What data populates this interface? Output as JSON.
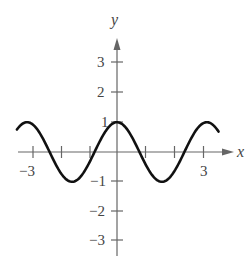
{
  "chart_data": {
    "type": "line",
    "title": "",
    "xlabel": "x",
    "ylabel": "y",
    "function": "y = cos(2x)",
    "xlim": [
      -3.5,
      3.6
    ],
    "ylim": [
      -3.5,
      3.7
    ],
    "x_ticks": [
      -3,
      -2,
      -1,
      1,
      2,
      3
    ],
    "x_tick_labels": [
      "-3",
      "3"
    ],
    "y_ticks": [
      -3,
      -2,
      -1,
      1,
      2,
      3
    ],
    "y_tick_labels": [
      "3",
      "2",
      "1",
      "−1",
      "−2",
      "−3"
    ],
    "series": [
      {
        "name": "cos(2x)",
        "x": [
          -3.5,
          -3.14,
          -2.36,
          -1.57,
          -0.79,
          0,
          0.79,
          1.57,
          2.36,
          3.14,
          3.55
        ],
        "values": [
          0.75,
          1,
          0,
          -1,
          0,
          1,
          0,
          -1,
          0,
          1,
          0.72
        ]
      }
    ],
    "grid": false,
    "legend": "none"
  },
  "labels": {
    "x_axis": "x",
    "y_axis": "y",
    "x_neg3": "−3",
    "x_pos3": "3",
    "y3": "3",
    "y2": "2",
    "y1": "1",
    "yn1": "−1",
    "yn2": "−2",
    "yn3": "−3"
  }
}
